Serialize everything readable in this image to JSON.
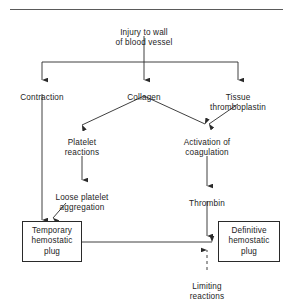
{
  "figure": {
    "top_rule": true,
    "line_color": "#2a2a2a",
    "text_color": "#1d1d1d",
    "background": "#ffffff"
  },
  "nodes": {
    "injury": {
      "label": "Injury to wall\nof blood vessel"
    },
    "contraction": {
      "label": "Contraction"
    },
    "collagen": {
      "label": "Collagen"
    },
    "tissue_thromboplastin": {
      "label": "Tissue\nthromboplastin"
    },
    "platelet_reactions": {
      "label": "Platelet\nreactions"
    },
    "activation_of_coagulation": {
      "label": "Activation of\ncoagulation"
    },
    "loose_platelet_aggregation": {
      "label": "Loose platelet\naggregation"
    },
    "thrombin": {
      "label": "Thrombin"
    },
    "temporary_hemostatic_plug": {
      "label": "Temporary\nhemostatic\nplug"
    },
    "definitive_hemostatic_plug": {
      "label": "Definitive\nhemostatic\nplug"
    },
    "limiting_reactions": {
      "label": "Limiting\nreactions"
    }
  },
  "edges": [
    {
      "from": "injury",
      "to": "contraction",
      "style": "solid"
    },
    {
      "from": "injury",
      "to": "collagen",
      "style": "solid"
    },
    {
      "from": "injury",
      "to": "tissue_thromboplastin",
      "style": "solid"
    },
    {
      "from": "collagen",
      "to": "platelet_reactions",
      "style": "solid"
    },
    {
      "from": "collagen",
      "to": "activation_of_coagulation",
      "style": "solid"
    },
    {
      "from": "tissue_thromboplastin",
      "to": "activation_of_coagulation",
      "style": "solid"
    },
    {
      "from": "platelet_reactions",
      "to": "loose_platelet_aggregation",
      "style": "solid"
    },
    {
      "from": "activation_of_coagulation",
      "to": "thrombin",
      "style": "solid"
    },
    {
      "from": "contraction",
      "to": "temporary_hemostatic_plug",
      "style": "solid"
    },
    {
      "from": "loose_platelet_aggregation",
      "to": "temporary_hemostatic_plug",
      "style": "solid"
    },
    {
      "from": "thrombin",
      "to": "definitive_hemostatic_plug",
      "style": "solid"
    },
    {
      "from": "temporary_hemostatic_plug",
      "to": "definitive_hemostatic_plug",
      "style": "solid"
    },
    {
      "from": "limiting_reactions",
      "to": "definitive_hemostatic_plug",
      "style": "dashed"
    }
  ]
}
